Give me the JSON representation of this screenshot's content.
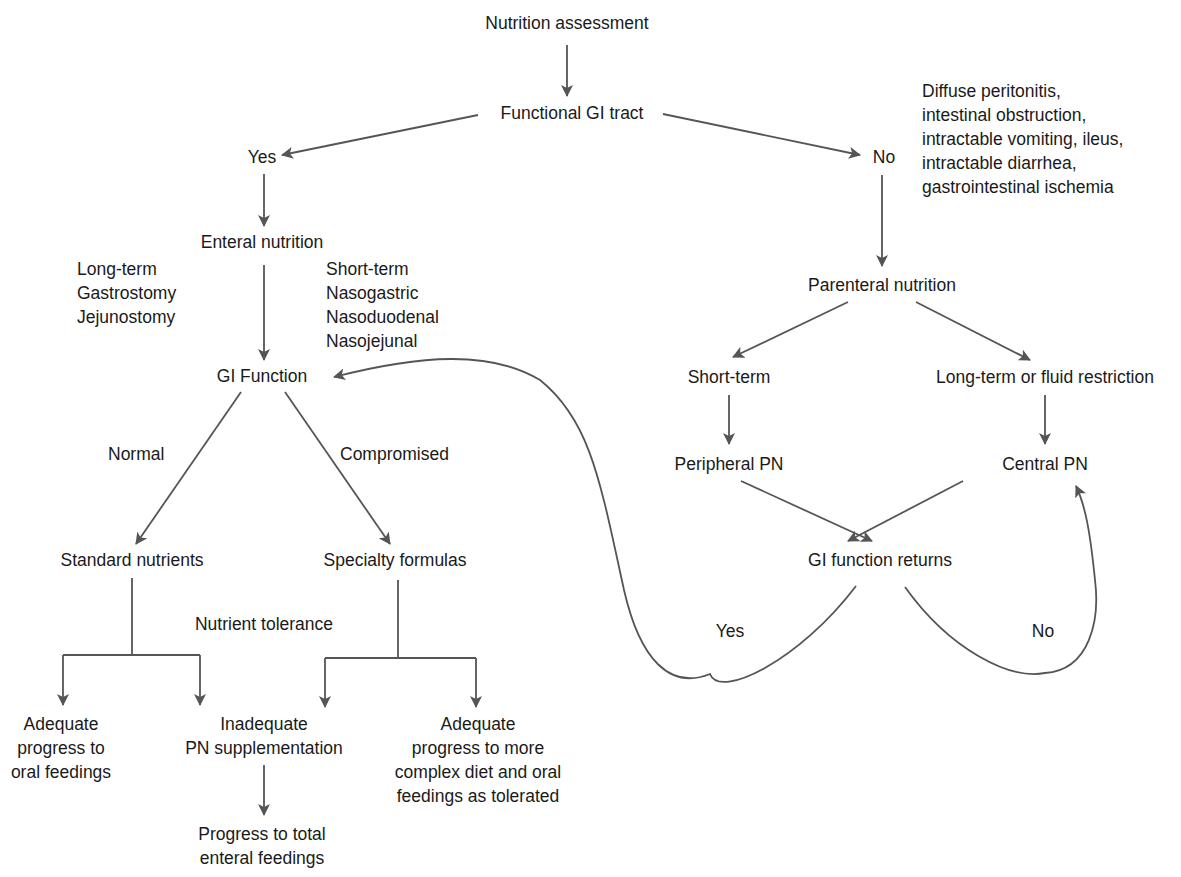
{
  "diagram": {
    "type": "flowchart",
    "title": "Nutrition assessment",
    "nodes": {
      "assessment": "Nutrition assessment",
      "functional_gi": "Functional GI tract",
      "yes": "Yes",
      "no": "No",
      "no_conditions": [
        "Diffuse peritonitis,",
        "intestinal obstruction,",
        "intractable vomiting, ileus,",
        "intractable diarrhea,",
        "gastrointestinal ischemia"
      ],
      "enteral": "Enteral nutrition",
      "long_term_access": [
        "Long-term",
        "Gastrostomy",
        "Jejunostomy"
      ],
      "short_term_access": [
        "Short-term",
        "Nasogastric",
        "Nasoduodenal",
        "Nasojejunal"
      ],
      "gi_function": "GI Function",
      "normal": "Normal",
      "compromised": "Compromised",
      "standard": "Standard nutrients",
      "specialty": "Specialty formulas",
      "nutrient_tolerance": "Nutrient tolerance",
      "adequate_oral": [
        "Adequate",
        "progress to",
        "oral feedings"
      ],
      "inadequate": [
        "Inadequate",
        "PN supplementation"
      ],
      "adequate_complex": [
        "Adequate",
        "progress to more",
        "complex diet and oral",
        "feedings as tolerated"
      ],
      "progress_total": [
        "Progress to total",
        "enteral feedings"
      ],
      "parenteral": "Parenteral nutrition",
      "pn_short": "Short-term",
      "pn_long": "Long-term or fluid restriction",
      "peripheral": "Peripheral PN",
      "central": "Central PN",
      "gi_returns": "GI function returns",
      "returns_yes": "Yes",
      "returns_no": "No"
    },
    "edges": [
      [
        "Nutrition assessment",
        "Functional GI tract"
      ],
      [
        "Functional GI tract",
        "Yes"
      ],
      [
        "Functional GI tract",
        "No"
      ],
      [
        "Yes",
        "Enteral nutrition"
      ],
      [
        "Enteral nutrition",
        "GI Function"
      ],
      [
        "GI Function",
        "Standard nutrients",
        "Normal"
      ],
      [
        "GI Function",
        "Specialty formulas",
        "Compromised"
      ],
      [
        "Standard nutrients",
        "Adequate progress to oral feedings"
      ],
      [
        "Standard nutrients",
        "Inadequate PN supplementation"
      ],
      [
        "Specialty formulas",
        "Inadequate PN supplementation"
      ],
      [
        "Specialty formulas",
        "Adequate progress to more complex diet"
      ],
      [
        "Inadequate PN supplementation",
        "Progress to total enteral feedings"
      ],
      [
        "No",
        "Parenteral nutrition"
      ],
      [
        "Parenteral nutrition",
        "Short-term"
      ],
      [
        "Parenteral nutrition",
        "Long-term or fluid restriction"
      ],
      [
        "Short-term",
        "Peripheral PN"
      ],
      [
        "Long-term or fluid restriction",
        "Central PN"
      ],
      [
        "Peripheral PN",
        "GI function returns"
      ],
      [
        "Central PN",
        "GI function returns"
      ],
      [
        "GI function returns",
        "GI Function",
        "Yes"
      ],
      [
        "GI function returns",
        "Central PN",
        "No"
      ]
    ],
    "colors": {
      "line": "#555555",
      "text": "#1a1a1a",
      "background": "#ffffff"
    }
  }
}
